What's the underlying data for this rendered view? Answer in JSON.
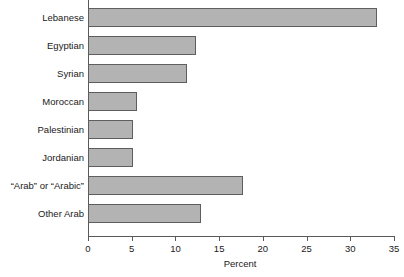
{
  "chart_data": {
    "type": "bar",
    "orientation": "horizontal",
    "title": "",
    "xlabel": "Percent",
    "ylabel": "",
    "categories": [
      "Lebanese",
      "Egyptian",
      "Syrian",
      "Moroccan",
      "Palestinian",
      "Jordanian",
      "“Arab” or “Arabic”",
      "Other Arab"
    ],
    "values": [
      33.1,
      12.4,
      11.3,
      5.6,
      5.1,
      5.1,
      17.7,
      12.9
    ],
    "xlim": [
      0,
      35
    ],
    "xticks": [
      0,
      5,
      10,
      15,
      20,
      25,
      30,
      35
    ],
    "xtick_labels": [
      "0",
      "5",
      "10",
      "15",
      "20",
      "25",
      "30",
      "35"
    ],
    "grid": false,
    "legend": false,
    "bar_fill_color": "#b3b3b3",
    "bar_edge_color": "#5e5e5e",
    "axis_color": "#58595b"
  }
}
